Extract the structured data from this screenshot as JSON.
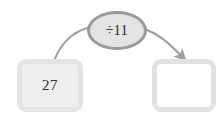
{
  "diagram": {
    "type": "function-machine",
    "input": {
      "value": "27",
      "filled": true
    },
    "operator": {
      "label": "÷11",
      "symbol": "÷",
      "operand": "11"
    },
    "output": {
      "value": "",
      "filled": false
    },
    "connectors": [
      {
        "name": "input-to-operator",
        "from": "input-box",
        "to": "operator-node",
        "arrowhead": false
      },
      {
        "name": "operator-to-output",
        "from": "operator-node",
        "to": "output-box",
        "arrowhead": true
      }
    ],
    "colors": {
      "connector": "#9e9e9e",
      "operator_border": "#9a9a9a",
      "operator_fill": "#e4e4e4",
      "box_border": "#e2e2e2",
      "input_fill": "#eeeeee",
      "output_fill": "#ffffff",
      "text": "#2b2b2b",
      "background": "#ffffff"
    }
  }
}
